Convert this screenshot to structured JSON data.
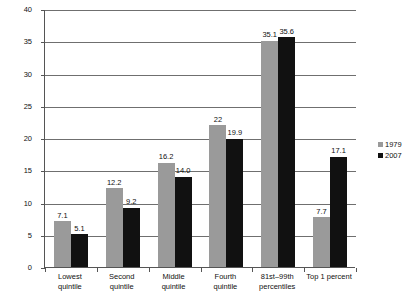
{
  "chart_data": {
    "type": "bar",
    "title": "",
    "subtitle": "",
    "xlabel": "",
    "ylabel": "Percent",
    "ylim": [
      0,
      40
    ],
    "ytick_step": 5,
    "yticks": [
      "0",
      "5",
      "10",
      "15",
      "20",
      "25",
      "30",
      "35",
      "40"
    ],
    "grid": true,
    "legend_position": "right",
    "categories": [
      "Lowest quintile",
      "Second quintile",
      "Middle quintile",
      "Fourth quintile",
      "81st–99th percentiles",
      "Top 1 percent"
    ],
    "category_lines": [
      [
        "Lowest",
        "quintile"
      ],
      [
        "Second",
        "quintile"
      ],
      [
        "Middle",
        "quintile"
      ],
      [
        "Fourth",
        "quintile"
      ],
      [
        "81st–99th",
        "percentiles"
      ],
      [
        "Top 1 percent"
      ]
    ],
    "series": [
      {
        "name": "1979",
        "color": "#9a9a9a",
        "values": [
          7.1,
          12.2,
          16.2,
          22,
          35.1,
          7.7
        ],
        "labels": [
          "7.1",
          "12.2",
          "16.2",
          "22",
          "35.1",
          "7.7"
        ]
      },
      {
        "name": "2007",
        "color": "#111111",
        "values": [
          5.1,
          9.2,
          14.0,
          19.9,
          35.6,
          17.1
        ],
        "labels": [
          "5.1",
          "9.2",
          "14.0",
          "19.9",
          "35.6",
          "17.1"
        ]
      }
    ]
  },
  "legend": {
    "items": [
      {
        "label": "1979",
        "marker": "square-gray"
      },
      {
        "label": "2007",
        "marker": "square-black"
      }
    ]
  },
  "axis": {
    "y_title": "Percent"
  }
}
